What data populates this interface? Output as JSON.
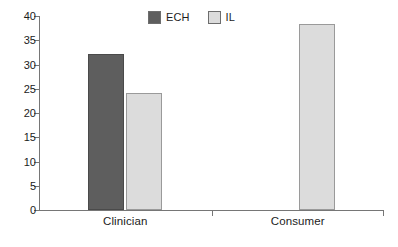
{
  "chart_data": {
    "type": "bar",
    "title": "",
    "subtitle": "",
    "xlabel": "",
    "ylabel": "",
    "ylim": [
      0,
      40
    ],
    "y_ticks": [
      0,
      5,
      10,
      15,
      20,
      25,
      30,
      35,
      40
    ],
    "grid": false,
    "legend_position": "top-center",
    "categories": [
      "Clinician",
      "Consumer"
    ],
    "series": [
      {
        "name": "ECH",
        "color": "#5e5e5e",
        "values": [
          32.2,
          0
        ]
      },
      {
        "name": "IL",
        "color": "#dcdcdc",
        "values": [
          24.2,
          38.3
        ]
      }
    ],
    "annotations": []
  },
  "legend": {
    "items": [
      {
        "label": "ECH",
        "swatch_color": "#5e5e5e"
      },
      {
        "label": "IL",
        "swatch_color": "#dcdcdc"
      }
    ]
  },
  "axes": {
    "y_tick_labels": [
      "40",
      "35",
      "30",
      "25",
      "20",
      "15",
      "10",
      "5",
      "0"
    ],
    "x_tick_labels": [
      "Clinician",
      "Consumer"
    ]
  },
  "colors": {
    "background": "#ffffff",
    "axis": "#767676",
    "text": "#1c1c1c",
    "series_ech": "#5e5e5e",
    "series_il": "#dcdcdc"
  }
}
